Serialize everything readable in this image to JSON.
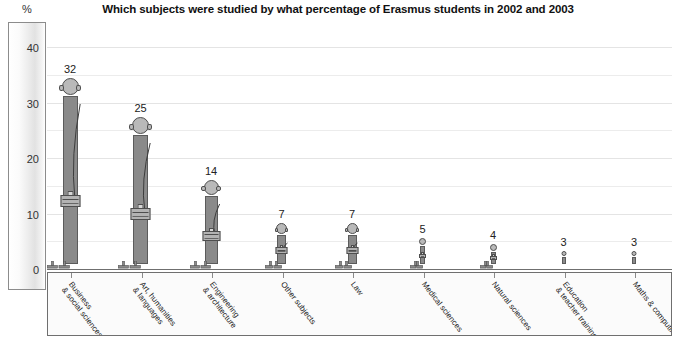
{
  "chart_data": {
    "type": "bar",
    "title": "Which subjects were studied by what percentage of Erasmus students in 2002 and 2003",
    "xlabel": "",
    "ylabel": "%",
    "ylim": [
      0,
      40
    ],
    "yticks": [
      "0",
      "10",
      "20",
      "30",
      "40"
    ],
    "ytick_values": [
      0,
      10,
      20,
      30,
      40
    ],
    "grid": true,
    "grid_step": 5,
    "legend": "none",
    "categories": [
      "Business\n& social sciences",
      "Art, humanities\n& languages",
      "Engineering\n& architecture",
      "Other subjects",
      "Law",
      "Medical sciences",
      "Natural sciences",
      "Education\n& teacher training",
      "Maths & computing"
    ],
    "values": [
      32,
      25,
      14,
      7,
      7,
      5,
      4,
      3,
      3
    ],
    "value_labels": [
      "32",
      "25",
      "14",
      "7",
      "7",
      "5",
      "4",
      "3",
      "3"
    ],
    "colors": {
      "bar_fill": "#8a8a8a",
      "bar_stroke": "#5b5b5b",
      "head_fill": "#b9b9b9",
      "bag_fill": "#b3b3b3",
      "gridline": "#ececec",
      "baseline": "#6f6f6f",
      "panel_border": "#6f6f6f",
      "text": "#1a1a1a"
    }
  },
  "axis": {
    "percent_sign": "%"
  }
}
